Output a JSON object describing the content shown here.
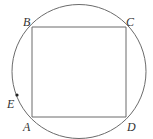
{
  "figure": {
    "colors": {
      "background": "#ffffff",
      "stroke": "#6b6b6b",
      "text": "#333333",
      "point": "#222222"
    },
    "circle": {
      "cx": 79,
      "cy": 71.5,
      "r": 67
    },
    "square": {
      "A": {
        "x": 32,
        "y": 117
      },
      "B": {
        "x": 32,
        "y": 27
      },
      "C": {
        "x": 126,
        "y": 27
      },
      "D": {
        "x": 126,
        "y": 117
      }
    },
    "point_E": {
      "x": 17,
      "y": 95
    },
    "labels": {
      "A": {
        "text": "A",
        "x": 23,
        "y": 131
      },
      "B": {
        "text": "B",
        "x": 23,
        "y": 26
      },
      "C": {
        "text": "C",
        "x": 126,
        "y": 26
      },
      "D": {
        "text": "D",
        "x": 127,
        "y": 131
      },
      "E": {
        "text": "E",
        "x": 7,
        "y": 108
      }
    }
  }
}
